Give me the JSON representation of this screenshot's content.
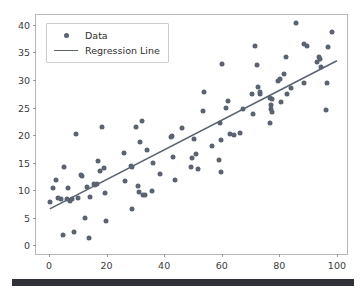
{
  "figure": {
    "background": "#ffffff",
    "frame_color": "#b8b8b8",
    "bottom_bar_color": "#2f3136"
  },
  "legend": {
    "position": "upper-left",
    "entries": [
      {
        "label": "Data",
        "key": "marker",
        "color": "#5b6370"
      },
      {
        "label": "Regression Line",
        "key": "line",
        "color": "#5b6370"
      }
    ]
  },
  "chart_data": {
    "type": "scatter",
    "title": "",
    "xlabel": "",
    "ylabel": "",
    "xlim": [
      -4.5,
      103.5
    ],
    "ylim": [
      -1.6,
      41.8
    ],
    "xticks": [
      0,
      20,
      40,
      60,
      80,
      100
    ],
    "yticks": [
      0,
      5,
      10,
      15,
      20,
      25,
      30,
      35,
      40
    ],
    "grid": false,
    "marker_color": "#5b6370",
    "marker_size": 5,
    "line_color": "#5b6370",
    "line_width": 1.6,
    "series": [
      {
        "name": "Data",
        "type": "scatter",
        "points": [
          [
            0.3,
            7.9
          ],
          [
            1.4,
            10.3
          ],
          [
            2.6,
            11.8
          ],
          [
            3.3,
            8.6
          ],
          [
            4.2,
            8.3
          ],
          [
            4.8,
            1.8
          ],
          [
            5.3,
            14.2
          ],
          [
            6.1,
            8.4
          ],
          [
            6.6,
            10.3
          ],
          [
            7.4,
            8.1
          ],
          [
            8.0,
            8.4
          ],
          [
            8.6,
            2.4
          ],
          [
            9.4,
            20.2
          ],
          [
            10.2,
            8.6
          ],
          [
            11.3,
            12.8
          ],
          [
            11.6,
            12.5
          ],
          [
            12.4,
            5.0
          ],
          [
            13.1,
            10.6
          ],
          [
            14.0,
            1.3
          ],
          [
            14.4,
            8.8
          ],
          [
            15.6,
            11.2
          ],
          [
            16.1,
            11.0
          ],
          [
            16.6,
            11.2
          ],
          [
            17.2,
            15.3
          ],
          [
            17.6,
            13.4
          ],
          [
            18.3,
            21.5
          ],
          [
            19.0,
            14.0
          ],
          [
            19.6,
            9.4
          ],
          [
            19.9,
            4.4
          ],
          [
            26.0,
            16.8
          ],
          [
            26.3,
            11.6
          ],
          [
            28.4,
            14.4
          ],
          [
            28.8,
            14.2
          ],
          [
            29.0,
            6.5
          ],
          [
            30.4,
            21.4
          ],
          [
            30.8,
            10.7
          ],
          [
            31.2,
            9.6
          ],
          [
            31.6,
            18.8
          ],
          [
            32.3,
            22.6
          ],
          [
            32.8,
            9.1
          ],
          [
            33.2,
            9.2
          ],
          [
            34.2,
            17.3
          ],
          [
            35.8,
            9.8
          ],
          [
            36.2,
            14.9
          ],
          [
            38.4,
            12.9
          ],
          [
            42.4,
            19.6
          ],
          [
            42.9,
            19.9
          ],
          [
            43.2,
            16.1
          ],
          [
            43.6,
            11.8
          ],
          [
            46.1,
            21.3
          ],
          [
            49.2,
            14.2
          ],
          [
            49.8,
            15.8
          ],
          [
            50.4,
            19.2
          ],
          [
            51.2,
            16.5
          ],
          [
            51.8,
            13.8
          ],
          [
            53.4,
            24.4
          ],
          [
            53.8,
            27.9
          ],
          [
            56.6,
            18.1
          ],
          [
            59.2,
            15.4
          ],
          [
            59.4,
            22.2
          ],
          [
            59.6,
            13.2
          ],
          [
            59.8,
            19.1
          ],
          [
            60.2,
            32.9
          ],
          [
            61.6,
            24.9
          ],
          [
            62.2,
            26.1
          ],
          [
            62.8,
            20.2
          ],
          [
            64.4,
            20.1
          ],
          [
            66.2,
            20.4
          ],
          [
            67.4,
            24.8
          ],
          [
            70.4,
            27.5
          ],
          [
            70.8,
            23.9
          ],
          [
            71.4,
            36.1
          ],
          [
            72.4,
            32.8
          ],
          [
            72.6,
            28.8
          ],
          [
            73.2,
            27.8
          ],
          [
            73.4,
            27.5
          ],
          [
            76.6,
            26.8
          ],
          [
            76.8,
            22.1
          ],
          [
            77.0,
            25.4
          ],
          [
            77.2,
            24.8
          ],
          [
            77.3,
            24.1
          ],
          [
            77.6,
            26.6
          ],
          [
            79.6,
            29.8
          ],
          [
            80.2,
            30.2
          ],
          [
            80.6,
            26.0
          ],
          [
            81.6,
            31.0
          ],
          [
            82.2,
            34.2
          ],
          [
            82.6,
            27.5
          ],
          [
            84.2,
            28.5
          ],
          [
            85.8,
            40.4
          ],
          [
            88.4,
            36.5
          ],
          [
            88.6,
            29.5
          ],
          [
            89.6,
            36.2
          ],
          [
            93.2,
            33.3
          ],
          [
            93.8,
            34.2
          ],
          [
            94.0,
            33.9
          ],
          [
            94.4,
            32.4
          ],
          [
            96.2,
            24.6
          ],
          [
            96.6,
            29.4
          ],
          [
            96.8,
            36.0
          ],
          [
            98.4,
            38.7
          ]
        ]
      },
      {
        "name": "Regression Line",
        "type": "line",
        "endpoints": [
          [
            0.3,
            6.6
          ],
          [
            100.0,
            33.5
          ]
        ],
        "slope": 0.27,
        "intercept": 6.5
      }
    ]
  }
}
